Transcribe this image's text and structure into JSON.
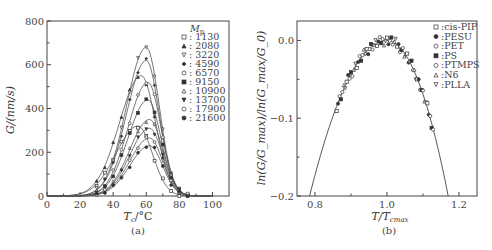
{
  "chart_data": [
    {
      "id": "a",
      "type": "line",
      "caption": "(a)",
      "xlabel": "T_c/°C",
      "ylabel": "G/(nm/s)",
      "xlim": [
        0,
        110
      ],
      "ylim": [
        0,
        800
      ],
      "xticks": [
        0,
        20,
        40,
        60,
        80,
        100
      ],
      "yticks": [
        0,
        200,
        400,
        600,
        800
      ],
      "grid": false,
      "legend_title": "Mp",
      "legend_position": "upper right",
      "series": [
        {
          "name": "1130",
          "marker": "square-open",
          "peak_x": 55,
          "peak_y": 320,
          "width": 15
        },
        {
          "name": "2080",
          "marker": "triangle-filled",
          "peak_x": 57,
          "peak_y": 550,
          "width": 15
        },
        {
          "name": "3220",
          "marker": "triangle-down-open",
          "peak_x": 60,
          "peak_y": 680,
          "width": 13.5
        },
        {
          "name": "4590",
          "marker": "diamond-filled",
          "peak_x": 60,
          "peak_y": 620,
          "width": 13.5
        },
        {
          "name": "6570",
          "marker": "circle-open",
          "peak_x": 61,
          "peak_y": 520,
          "width": 13.5
        },
        {
          "name": "9150",
          "marker": "square-filled",
          "peak_x": 61,
          "peak_y": 440,
          "width": 13.5
        },
        {
          "name": "10900",
          "marker": "triangle-open",
          "peak_x": 62,
          "peak_y": 350,
          "width": 13.5
        },
        {
          "name": "13700",
          "marker": "triangle-down-filled",
          "peak_x": 62,
          "peak_y": 310,
          "width": 13.5
        },
        {
          "name": "17900",
          "marker": "circle-open-small",
          "peak_x": 62,
          "peak_y": 265,
          "width": 13.5
        },
        {
          "name": "21600",
          "marker": "circle-filled",
          "peak_x": 62,
          "peak_y": 230,
          "width": 13.5
        }
      ]
    },
    {
      "id": "b",
      "type": "scatter",
      "caption": "(b)",
      "xlabel": "T/T_cmax",
      "ylabel": "ln(G/G_max)/ln(G_max/G_0)",
      "xlim": [
        0.75,
        1.25
      ],
      "ylim": [
        -0.2,
        0.025
      ],
      "xticks": [
        0.8,
        1.0,
        1.2
      ],
      "xtick_labels": [
        "0.8",
        "1.0",
        "1.2"
      ],
      "yticks": [
        0.0,
        -0.1,
        -0.2
      ],
      "ytick_labels": [
        "0.0",
        "−0.1",
        "−0.2"
      ],
      "grid": false,
      "legend_position": "upper right",
      "fit_curve": {
        "description": "master parabola",
        "vertex": [
          1.0,
          0.0
        ],
        "x_at_minus_0_2": [
          0.785,
          1.17
        ]
      },
      "series": [
        {
          "name": "cis-PIP",
          "marker": "square-open"
        },
        {
          "name": "PESU",
          "marker": "circle-hatched"
        },
        {
          "name": "PET",
          "marker": "circle-open"
        },
        {
          "name": "PS",
          "marker": "square-half"
        },
        {
          "name": "PTMPS",
          "marker": "hexagon-open"
        },
        {
          "name": "N6",
          "marker": "triangle-open"
        },
        {
          "name": "PLLA",
          "marker": "triangle-down-open"
        }
      ],
      "scatter_range_x": [
        0.86,
        1.13
      ]
    }
  ],
  "labels": {
    "a_ylabel": "G/(nm/s)",
    "a_xlabel_main": "T",
    "a_xlabel_sub": "c",
    "a_xlabel_unit": "/°C",
    "a_legend_title_main": "M",
    "a_legend_title_sub": "p",
    "b_ylabel": "ln(G/G_max)/ln(G_max/G_0)",
    "b_xlabel_main": "T/T",
    "b_xlabel_sub": "cmax",
    "caption_a": "(a)",
    "caption_b": "(b)"
  }
}
